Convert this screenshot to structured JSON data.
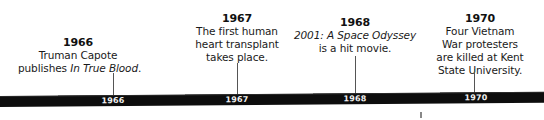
{
  "timeline": {
    "events": [
      {
        "year": "1966",
        "lines": [
          "Truman Capote"
        ],
        "line2_prefix": "publishes ",
        "line2_italic": "In True Blood",
        "line2_suffix": "."
      },
      {
        "year": "1967",
        "lines": [
          "The first human",
          "heart transplant",
          "takes place."
        ]
      },
      {
        "year": "1968",
        "line1_italic": "2001: A Space Odyssey",
        "lines": [
          "is a hit movie."
        ]
      },
      {
        "year": "1970",
        "lines": [
          "Four Vietnam",
          "War protesters",
          "are killed at Kent",
          "State University."
        ]
      }
    ],
    "bar_labels": [
      "1966",
      "1967",
      "1968",
      "1970"
    ],
    "colors": {
      "bar": "#0d0d0d",
      "bar_label": "#f2f2f2",
      "connector": "#555555",
      "text": "#1a1a1a"
    }
  }
}
